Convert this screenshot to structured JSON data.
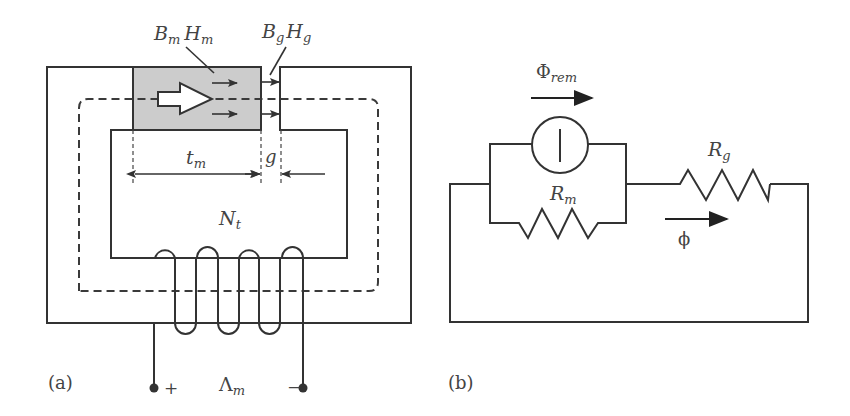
{
  "figure_a": {
    "panel_label": "(a)",
    "magnet_label_B": "B",
    "magnet_label_B_sub": "m",
    "magnet_label_H": "H",
    "magnet_label_H_sub": "m",
    "gap_label_B": "B",
    "gap_label_B_sub": "g",
    "gap_label_H": "H",
    "gap_label_H_sub": "g",
    "thickness_label": "t",
    "thickness_label_sub": "m",
    "gap_dim_label": "g",
    "turns_label": "N",
    "turns_label_sub": "t",
    "terminal_plus": "+",
    "terminal_minus": "−",
    "flux_linkage_label": "Λ",
    "flux_linkage_label_sub": "m",
    "magnet_fill": "#cccccc"
  },
  "figure_b": {
    "panel_label": "(b)",
    "source_flux_label": "Φ",
    "source_flux_label_sub": "rem",
    "magnet_reluctance_label": "R",
    "magnet_reluctance_label_sub": "m",
    "gap_reluctance_label": "R",
    "gap_reluctance_label_sub": "g",
    "loop_flux_label": "ϕ"
  }
}
